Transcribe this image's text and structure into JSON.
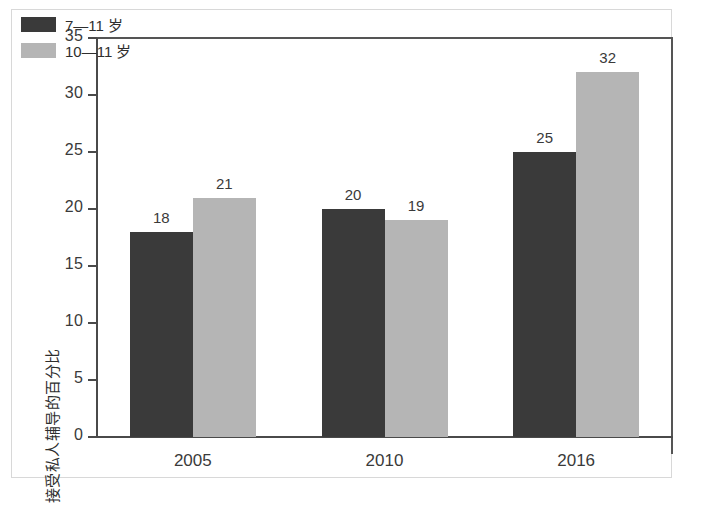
{
  "chart_data": {
    "type": "bar",
    "title": "",
    "subtitle": "",
    "xlabel": "",
    "ylabel": "接受私人辅导的百分比",
    "categories": [
      "2005",
      "2010",
      "2016"
    ],
    "series": [
      {
        "name": "7—11 岁",
        "values": [
          18,
          20,
          25
        ],
        "color": "#3a3a3a"
      },
      {
        "name": "10—11 岁",
        "values": [
          21,
          19,
          32
        ],
        "color": "#b5b5b5"
      }
    ],
    "ylim": [
      0,
      35
    ],
    "yticks": [
      0,
      5,
      10,
      15,
      20,
      25,
      30,
      35
    ],
    "ytick_labels": [
      "0",
      "5",
      "10",
      "15",
      "20",
      "25",
      "30",
      "35"
    ],
    "grid": false,
    "legend_position": "top-left",
    "show_data_labels": true,
    "axis_color": "#4a4a4a",
    "frame_color": "#555555",
    "background": "#ffffff"
  },
  "legend": {
    "items": [
      {
        "label": "7—11 岁",
        "color": "#3a3a3a"
      },
      {
        "label": "10—11 岁",
        "color": "#b5b5b5"
      }
    ]
  }
}
